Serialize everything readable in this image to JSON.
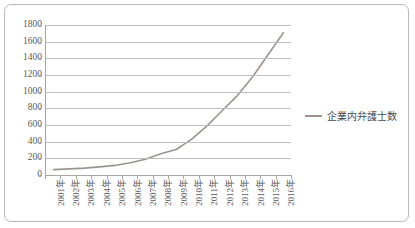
{
  "chart_data": {
    "type": "line",
    "title": "",
    "xlabel": "",
    "ylabel": "",
    "ylim": [
      0,
      1800
    ],
    "ytick_step": 200,
    "yticks": [
      0,
      200,
      400,
      600,
      800,
      1000,
      1200,
      1400,
      1600,
      1800
    ],
    "ytick_labels": [
      "0",
      "200",
      "400",
      "600",
      "800",
      "1000",
      "1200",
      "1400",
      "1600",
      "1800"
    ],
    "grid": "horizontal",
    "legend_position": "right",
    "categories": [
      "2001年",
      "2002年",
      "2003年",
      "2004年",
      "2005年",
      "2006年",
      "2007年",
      "2008年",
      "2009年",
      "2010年",
      "2011年",
      "2012年",
      "2013年",
      "2014年",
      "2015年",
      "2016年"
    ],
    "series": [
      {
        "name": "企業内弁護士数",
        "color": "#9a948f",
        "values": [
          64,
          73,
          83,
          98,
          115,
          146,
          188,
          256,
          306,
          428,
          587,
          771,
          953,
          1179,
          1442,
          1707
        ]
      }
    ]
  },
  "legend": {
    "entries": [
      {
        "label": "企業内弁護士数",
        "swatch": "line-swatch",
        "color": "#9a948f"
      }
    ]
  },
  "colors": {
    "series_line": "#9a948f",
    "gridline": "#bfbfbf",
    "axis": "#a6a6a6",
    "frame_border": "#b9b9b9",
    "tick_text": "#5a5a5a",
    "legend_text": "#4a4a4a",
    "background": "#ffffff"
  }
}
